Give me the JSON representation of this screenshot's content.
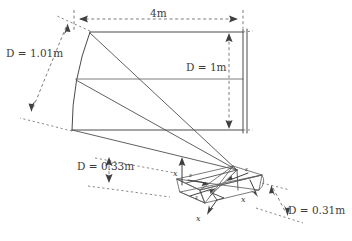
{
  "figure": {
    "background_color": "#ffffff",
    "line_color": "#4a4a4a",
    "dimension_color": "#6d6d6d",
    "text_color": "#3c3c3c"
  },
  "dimensions": [
    {
      "id": "width-top",
      "label": "4m",
      "variable": "",
      "value": "4m",
      "orientation": "horizontal",
      "location": "top",
      "describes": "main-reflector-aperture-width"
    },
    {
      "id": "diameter-left",
      "label": "D = 1.01m",
      "variable": "D",
      "value": "1.01m",
      "orientation": "diagonal",
      "location": "left",
      "describes": "main-reflector-projected-diameter"
    },
    {
      "id": "diameter-right",
      "label": "D = 1m",
      "variable": "D",
      "value": "1m",
      "orientation": "vertical",
      "location": "interior-right",
      "describes": "main-reflector-aperture-height"
    },
    {
      "id": "diameter-sub-left",
      "label": "D = 0.33m",
      "variable": "D",
      "value": "0.33m",
      "orientation": "vertical",
      "location": "lower-left",
      "describes": "subreflector-diameter"
    },
    {
      "id": "diameter-sub-right",
      "label": "D = 0.31m",
      "variable": "D",
      "value": "0.31m",
      "orientation": "diagonal",
      "location": "lower-right",
      "describes": "subreflector-projected-diameter"
    }
  ],
  "axis_labels": [
    {
      "id": "axis-sub-top",
      "label": "x",
      "position": "subreflector-upper-left-vertical-arrow"
    },
    {
      "id": "axis-sub-inner1",
      "label": "z",
      "position": "subreflector-inner-upper"
    },
    {
      "id": "axis-sub-inner2",
      "label": "z",
      "position": "subreflector-inner-lower"
    },
    {
      "id": "axis-sub-right",
      "label": "z",
      "position": "subreflector-upper-right"
    },
    {
      "id": "axis-sub-end",
      "label": "x",
      "position": "subreflector-right-end"
    },
    {
      "id": "axis-sub-bottom",
      "label": "x",
      "position": "subreflector-lower-open-arrow"
    }
  ],
  "components": [
    {
      "id": "main-reflector",
      "name": "main reflector",
      "shape": "curved quadrilateral"
    },
    {
      "id": "wall-screen",
      "name": "aperture plane",
      "shape": "double vertical line"
    },
    {
      "id": "subreflector",
      "name": "subreflector assembly",
      "shape": "small curved quadrilateral with axis triads"
    },
    {
      "id": "ray-bundle",
      "name": "ray bundle",
      "shape": "converging straight lines"
    }
  ]
}
